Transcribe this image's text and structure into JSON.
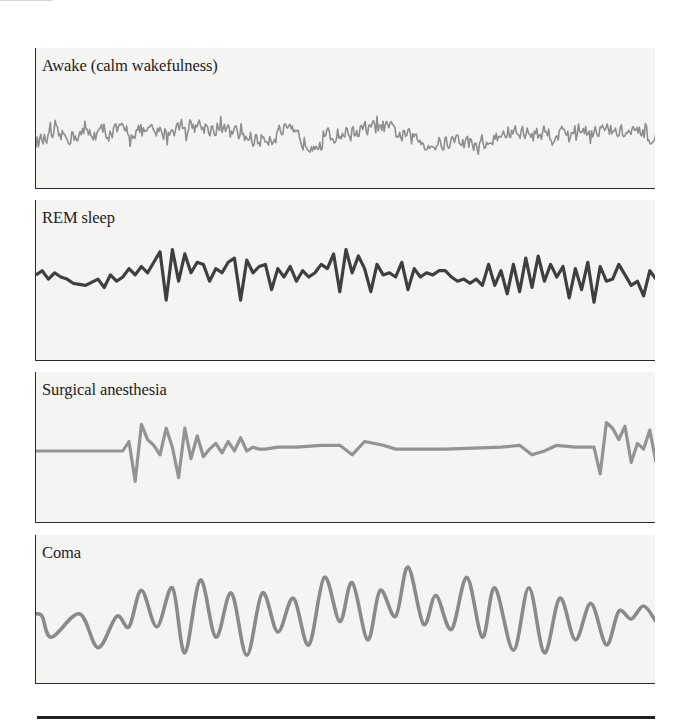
{
  "figure": {
    "panels": [
      {
        "id": "awake",
        "label": "Awake (calm wakefulness)",
        "trace_color": "#8e8e8e"
      },
      {
        "id": "rem",
        "label": "REM sleep",
        "trace_color": "#3f3f3f"
      },
      {
        "id": "surgical",
        "label": "Surgical anesthesia",
        "trace_color": "#939393"
      },
      {
        "id": "coma",
        "label": "Coma",
        "trace_color": "#8a8a8a"
      }
    ]
  },
  "chart_data": [
    {
      "type": "line",
      "title": "Awake (calm wakefulness)",
      "description": "High-frequency, low-amplitude irregular EEG activity",
      "xlabel": "",
      "ylabel": "",
      "grid": false,
      "x_range": [
        0,
        100
      ],
      "y_range": [
        -1,
        1
      ],
      "series": [
        {
          "name": "Awake (calm wakefulness)",
          "style": "dense-noise",
          "envelope_x": [
            0,
            4,
            8,
            12,
            16,
            20,
            24,
            28,
            32,
            36,
            40,
            44,
            48,
            52,
            56,
            60,
            64,
            68,
            72,
            76,
            80,
            84,
            88,
            92,
            96,
            100
          ],
          "envelope_center": [
            -0.15,
            0.0,
            0.1,
            0.15,
            0.2,
            0.1,
            0.4,
            0.3,
            0.1,
            -0.1,
            0.2,
            -0.2,
            0.05,
            0.2,
            0.3,
            0.0,
            -0.25,
            -0.1,
            -0.3,
            0.15,
            0.1,
            0.1,
            0.25,
            0.2,
            0.1,
            -0.1
          ],
          "amplitude": 0.35
        }
      ]
    },
    {
      "type": "line",
      "title": "REM sleep",
      "description": "Irregular mixed-frequency activity with sharp spikes",
      "xlabel": "",
      "ylabel": "",
      "grid": false,
      "x_range": [
        0,
        100
      ],
      "y_range": [
        -1,
        1
      ],
      "series": [
        {
          "name": "REM sleep",
          "x": [
            0,
            1,
            2,
            3,
            4,
            5,
            6,
            8,
            10,
            11,
            12,
            13,
            14,
            15,
            16,
            17,
            18,
            19,
            20,
            21,
            22,
            23,
            24,
            25,
            26,
            27,
            28,
            29,
            30,
            31,
            32,
            33,
            34,
            35,
            36,
            37,
            38,
            39,
            40,
            41,
            42,
            43,
            44,
            45,
            46,
            47,
            48,
            49,
            50,
            51,
            52,
            53,
            54,
            55,
            56,
            57,
            58,
            59,
            60,
            61,
            62,
            63,
            64,
            65,
            66,
            67,
            68,
            69,
            70,
            71,
            72,
            73,
            74,
            75,
            76,
            77,
            78,
            79,
            80,
            81,
            82,
            83,
            84,
            85,
            86,
            87,
            88,
            89,
            90,
            91,
            92,
            93,
            94,
            95,
            96,
            97,
            98,
            99,
            100
          ],
          "y": [
            0.05,
            0.15,
            -0.05,
            0.1,
            0.0,
            -0.05,
            -0.15,
            -0.2,
            -0.05,
            -0.25,
            0.05,
            -0.1,
            0.0,
            0.2,
            0.05,
            0.25,
            0.1,
            0.35,
            0.6,
            -0.55,
            0.65,
            -0.1,
            0.55,
            0.1,
            0.35,
            0.3,
            -0.1,
            0.2,
            0.1,
            0.35,
            0.45,
            -0.55,
            0.4,
            0.1,
            0.25,
            0.3,
            -0.3,
            0.2,
            0.0,
            0.25,
            -0.1,
            0.15,
            0.0,
            0.1,
            0.3,
            0.2,
            0.55,
            -0.35,
            0.65,
            0.1,
            0.5,
            0.2,
            -0.35,
            0.3,
            0.05,
            0.1,
            0.0,
            0.35,
            -0.3,
            0.2,
            0.0,
            0.1,
            0.05,
            0.15,
            0.15,
            0.0,
            -0.1,
            -0.05,
            -0.15,
            -0.05,
            -0.2,
            0.3,
            -0.2,
            0.15,
            -0.4,
            0.3,
            -0.35,
            0.45,
            -0.25,
            0.5,
            -0.1,
            0.3,
            0.0,
            0.25,
            -0.5,
            0.2,
            -0.3,
            0.35,
            -0.6,
            0.25,
            -0.1,
            -0.05,
            0.3,
            0.05,
            -0.2,
            -0.1,
            -0.45,
            0.15,
            -0.05
          ]
        }
      ]
    },
    {
      "type": "line",
      "title": "Surgical anesthesia",
      "description": "Burst-suppression pattern: flat baseline with intermittent bursts",
      "xlabel": "",
      "ylabel": "",
      "grid": false,
      "x_range": [
        0,
        100
      ],
      "y_range": [
        -1,
        1
      ],
      "series": [
        {
          "name": "Surgical anesthesia",
          "x": [
            0,
            14,
            15,
            16,
            17,
            18,
            19,
            20,
            21,
            22,
            23,
            24,
            25,
            26,
            27,
            28,
            29,
            30,
            31,
            32,
            33,
            34,
            35,
            36,
            37,
            39,
            42,
            46,
            49,
            51,
            53,
            56,
            58,
            60,
            62,
            66,
            75,
            78,
            80,
            82,
            84,
            87,
            90,
            91,
            92,
            93,
            94,
            95,
            96,
            97,
            98,
            99,
            100
          ],
          "y": [
            0.0,
            0.0,
            0.25,
            -0.8,
            0.7,
            0.3,
            0.15,
            -0.1,
            0.6,
            0.1,
            -0.7,
            0.6,
            -0.2,
            0.4,
            -0.15,
            0.05,
            0.2,
            -0.05,
            0.25,
            0.0,
            0.35,
            0.0,
            0.1,
            0.05,
            0.05,
            0.1,
            0.1,
            0.15,
            0.15,
            -0.1,
            0.25,
            0.15,
            0.05,
            0.05,
            0.05,
            0.05,
            0.1,
            0.15,
            -0.1,
            0.0,
            0.15,
            0.1,
            0.1,
            -0.6,
            0.75,
            0.6,
            0.3,
            0.65,
            -0.3,
            0.2,
            0.05,
            0.55,
            -0.3,
            -0.25,
            0.3,
            0.15,
            0.1,
            0.2,
            0.05
          ]
        }
      ]
    },
    {
      "type": "line",
      "title": "Coma",
      "description": "Large-amplitude slow delta waves",
      "xlabel": "",
      "ylabel": "",
      "grid": false,
      "x_range": [
        0,
        100
      ],
      "y_range": [
        -1,
        1
      ],
      "series": [
        {
          "name": "Coma",
          "x": [
            0,
            1,
            2.5,
            7,
            10,
            13,
            15,
            17,
            19.5,
            22,
            24,
            26.5,
            29,
            31.5,
            34,
            36.5,
            39,
            41.5,
            44,
            46.5,
            49,
            51,
            53.5,
            55.5,
            58,
            60,
            62.5,
            64.5,
            67,
            69.5,
            72,
            74,
            77,
            79.5,
            82,
            84.5,
            87,
            89.5,
            92,
            94,
            96,
            98,
            100
          ],
          "y": [
            0.1,
            0.05,
            -0.35,
            0.1,
            -0.55,
            0.05,
            -0.15,
            0.55,
            -0.15,
            0.6,
            -0.65,
            0.75,
            -0.35,
            0.5,
            -0.7,
            0.5,
            -0.25,
            0.4,
            -0.5,
            0.8,
            -0.05,
            0.7,
            -0.4,
            0.55,
            0.05,
            1.0,
            -0.1,
            0.45,
            -0.2,
            0.8,
            -0.35,
            0.6,
            -0.6,
            0.6,
            -0.65,
            0.4,
            -0.4,
            0.3,
            -0.5,
            0.15,
            0.0,
            0.25,
            -0.05
          ]
        }
      ]
    }
  ]
}
